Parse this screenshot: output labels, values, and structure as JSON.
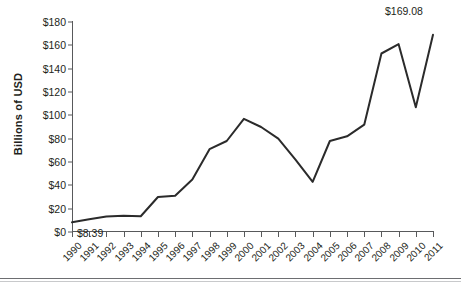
{
  "chart_data": {
    "type": "line",
    "title": "",
    "xlabel": "",
    "ylabel": "Billions of USD",
    "ylim": [
      0,
      180
    ],
    "ytick_values": [
      0,
      20,
      40,
      60,
      80,
      100,
      120,
      140,
      160,
      180
    ],
    "ytick_labels": [
      "$0",
      "$20",
      "$40",
      "$60",
      "$80",
      "$100",
      "$120",
      "$140",
      "$160",
      "$180"
    ],
    "grid": false,
    "legend": "none",
    "categories": [
      "1990",
      "1991",
      "1992",
      "1993",
      "1994",
      "1995",
      "1996",
      "1997",
      "1998",
      "1999",
      "2000",
      "2001",
      "2002",
      "2003",
      "2004",
      "2005",
      "2006",
      "2007",
      "2008",
      "2009",
      "2010",
      "2011"
    ],
    "values": [
      8.39,
      11.0,
      13.2,
      14.0,
      13.5,
      30.0,
      31.0,
      45.0,
      71.0,
      78.0,
      97.0,
      90.0,
      80.0,
      62.0,
      43.0,
      78.0,
      82.0,
      92.0,
      153.0,
      161.0,
      107.0,
      169.08
    ],
    "annotations": [
      {
        "label": "$8.39",
        "category": "1990",
        "value": 8.39,
        "position": "below-right"
      },
      {
        "label": "$169.08",
        "category": "2011",
        "value": 169.08,
        "position": "above-left"
      }
    ],
    "line_color": "#2b2b2b",
    "line_width": 2,
    "axis_color": "#58595b"
  }
}
